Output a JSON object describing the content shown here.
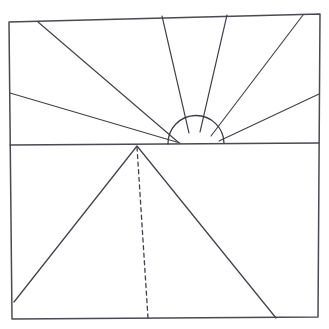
{
  "figure": {
    "medium": "pen line drawing",
    "background_color": "#ffffff",
    "ink_color": "#3c3c46",
    "canvas": {
      "width": 329,
      "height": 329
    }
  },
  "elements": {
    "frame": {
      "name": "outer rectangle border",
      "points": "9,22 320,14 318,317 12,319",
      "closed": true
    },
    "horizon": {
      "name": "horizon line",
      "x1": 10,
      "y1": 145,
      "x2": 319,
      "y2": 143
    },
    "sun": {
      "name": "rising sun semicircle",
      "center_x": 196,
      "center_y": 144,
      "radius": 28,
      "path": "M 168 144 A 28 28 0 0 1 224 143"
    },
    "rays": [
      {
        "id": "ray-1",
        "label": "ray to upper-left",
        "x1": 178,
        "y1": 142,
        "x2": 38,
        "y2": 22
      },
      {
        "id": "ray-2",
        "label": "ray to left edge",
        "x1": 180,
        "y1": 143,
        "x2": 10,
        "y2": 93
      },
      {
        "id": "ray-3",
        "label": "ray to top edge left-center",
        "x1": 189,
        "y1": 133,
        "x2": 162,
        "y2": 16
      },
      {
        "id": "ray-4",
        "label": "ray to top edge right-center",
        "x1": 200,
        "y1": 132,
        "x2": 227,
        "y2": 15
      },
      {
        "id": "ray-5",
        "label": "ray to upper-right",
        "x1": 211,
        "y1": 136,
        "x2": 303,
        "y2": 15
      },
      {
        "id": "ray-6",
        "label": "ray to right edge",
        "x1": 219,
        "y1": 141,
        "x2": 319,
        "y2": 94
      }
    ],
    "triangle": {
      "name": "pyramid triangle below horizon",
      "apex_x": 137,
      "apex_y": 146,
      "left_x": 14,
      "left_y": 302,
      "right_x": 276,
      "right_y": 318
    },
    "dashed_center_line": {
      "name": "dashed vertical axis of triangle",
      "x1": 137,
      "y1": 147,
      "x2": 148,
      "y2": 318
    }
  }
}
